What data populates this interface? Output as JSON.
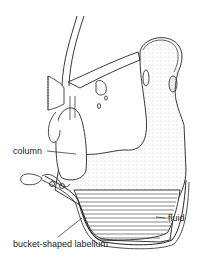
{
  "figure": {
    "labels": {
      "column": "column",
      "fluid": "fluid",
      "labellum": "bucket-shaped labellum"
    },
    "colors": {
      "line": "#222222",
      "background": "#ffffff",
      "stipple": "#9a9a9a"
    }
  }
}
